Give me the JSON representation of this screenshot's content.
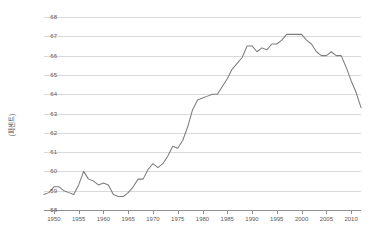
{
  "chart_data": {
    "type": "line",
    "title": "",
    "subtitle": "",
    "xlabel": "",
    "ylabel": "(퍼센트)",
    "ylim": [
      58,
      68
    ],
    "xlim": [
      1948,
      2012
    ],
    "grid": true,
    "legend": false,
    "legend_position": "none",
    "y_ticks": [
      68,
      67,
      66,
      65,
      64,
      63,
      62,
      61,
      60,
      59,
      58
    ],
    "x_ticks": [
      1950,
      1955,
      1960,
      1965,
      1970,
      1975,
      1980,
      1985,
      1990,
      1995,
      2000,
      2005,
      2010
    ],
    "series": [
      {
        "name": "labor-force-participation-rate",
        "color": "#7d7d7d",
        "x": [
          1948,
          1949,
          1950,
          1951,
          1952,
          1953,
          1954,
          1955,
          1956,
          1957,
          1958,
          1959,
          1960,
          1961,
          1962,
          1963,
          1964,
          1965,
          1966,
          1967,
          1968,
          1969,
          1970,
          1971,
          1972,
          1973,
          1974,
          1975,
          1976,
          1977,
          1978,
          1979,
          1980,
          1981,
          1982,
          1983,
          1984,
          1985,
          1986,
          1987,
          1988,
          1989,
          1990,
          1991,
          1992,
          1993,
          1994,
          1995,
          1996,
          1997,
          1998,
          1999,
          2000,
          2001,
          2002,
          2003,
          2004,
          2005,
          2006,
          2007,
          2008,
          2009,
          2010,
          2011,
          2012
        ],
        "values": [
          58.8,
          58.9,
          59.2,
          59.2,
          59.0,
          58.9,
          58.8,
          59.3,
          60.0,
          59.6,
          59.5,
          59.3,
          59.4,
          59.3,
          58.8,
          58.7,
          58.7,
          58.9,
          59.2,
          59.6,
          59.6,
          60.1,
          60.4,
          60.2,
          60.4,
          60.8,
          61.3,
          61.2,
          61.6,
          62.3,
          63.2,
          63.7,
          63.8,
          63.9,
          64.0,
          64.0,
          64.4,
          64.8,
          65.3,
          65.6,
          65.9,
          66.5,
          66.5,
          66.2,
          66.4,
          66.3,
          66.6,
          66.6,
          66.8,
          67.1,
          67.1,
          67.1,
          67.1,
          66.8,
          66.6,
          66.2,
          66.0,
          66.0,
          66.2,
          66.0,
          66.0,
          65.4,
          64.7,
          64.1,
          63.3
        ]
      }
    ]
  }
}
